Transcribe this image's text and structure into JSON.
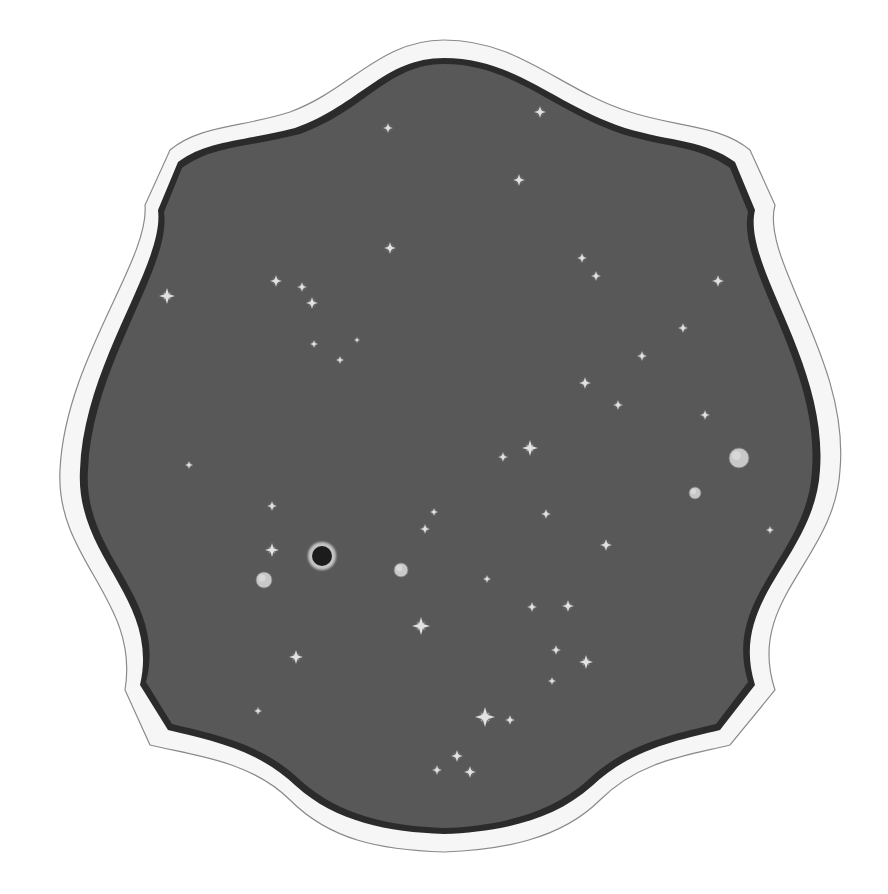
{
  "scene": {
    "description": "Painted star map inside an ornate scalloped white frame",
    "background_color": "#ffffff",
    "sky_color": "#585858",
    "frame_color": "#f4f4f4",
    "frame_shadow": "#2a2a2a"
  },
  "stars": [
    {
      "x": 388,
      "y": 128,
      "r": 5
    },
    {
      "x": 540,
      "y": 112,
      "r": 6
    },
    {
      "x": 519,
      "y": 180,
      "r": 6
    },
    {
      "x": 390,
      "y": 248,
      "r": 6
    },
    {
      "x": 167,
      "y": 296,
      "r": 8
    },
    {
      "x": 276,
      "y": 281,
      "r": 6
    },
    {
      "x": 302,
      "y": 287,
      "r": 5
    },
    {
      "x": 312,
      "y": 303,
      "r": 6
    },
    {
      "x": 314,
      "y": 344,
      "r": 4
    },
    {
      "x": 340,
      "y": 360,
      "r": 4
    },
    {
      "x": 357,
      "y": 340,
      "r": 3
    },
    {
      "x": 582,
      "y": 258,
      "r": 5
    },
    {
      "x": 596,
      "y": 276,
      "r": 5
    },
    {
      "x": 718,
      "y": 281,
      "r": 6
    },
    {
      "x": 683,
      "y": 328,
      "r": 5
    },
    {
      "x": 642,
      "y": 356,
      "r": 5
    },
    {
      "x": 585,
      "y": 383,
      "r": 6
    },
    {
      "x": 618,
      "y": 405,
      "r": 5
    },
    {
      "x": 705,
      "y": 415,
      "r": 5
    },
    {
      "x": 530,
      "y": 448,
      "r": 8
    },
    {
      "x": 503,
      "y": 457,
      "r": 5
    },
    {
      "x": 189,
      "y": 465,
      "r": 4
    },
    {
      "x": 546,
      "y": 514,
      "r": 5
    },
    {
      "x": 434,
      "y": 512,
      "r": 4
    },
    {
      "x": 425,
      "y": 529,
      "r": 5
    },
    {
      "x": 272,
      "y": 506,
      "r": 5
    },
    {
      "x": 272,
      "y": 550,
      "r": 7
    },
    {
      "x": 606,
      "y": 545,
      "r": 6
    },
    {
      "x": 770,
      "y": 530,
      "r": 4
    },
    {
      "x": 487,
      "y": 579,
      "r": 4
    },
    {
      "x": 532,
      "y": 607,
      "r": 5
    },
    {
      "x": 568,
      "y": 606,
      "r": 6
    },
    {
      "x": 421,
      "y": 626,
      "r": 9
    },
    {
      "x": 556,
      "y": 650,
      "r": 5
    },
    {
      "x": 586,
      "y": 662,
      "r": 7
    },
    {
      "x": 552,
      "y": 681,
      "r": 4
    },
    {
      "x": 296,
      "y": 657,
      "r": 7
    },
    {
      "x": 258,
      "y": 711,
      "r": 4
    },
    {
      "x": 485,
      "y": 717,
      "r": 10
    },
    {
      "x": 510,
      "y": 720,
      "r": 5
    },
    {
      "x": 457,
      "y": 756,
      "r": 6
    },
    {
      "x": 470,
      "y": 772,
      "r": 6
    },
    {
      "x": 437,
      "y": 770,
      "r": 5
    }
  ],
  "planets": [
    {
      "x": 739,
      "y": 458,
      "r": 10,
      "fill": "#c8c8c8"
    },
    {
      "x": 695,
      "y": 493,
      "r": 6,
      "fill": "#c8c8c8"
    },
    {
      "x": 264,
      "y": 580,
      "r": 8,
      "fill": "#c8c8c8"
    },
    {
      "x": 401,
      "y": 570,
      "r": 7,
      "fill": "#c8c8c8"
    }
  ],
  "eclipse": {
    "x": 322,
    "y": 556,
    "r": 10
  }
}
